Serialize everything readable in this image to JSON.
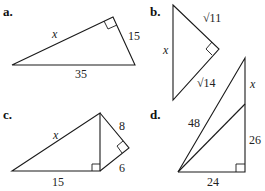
{
  "diagram": {
    "type": "right-triangle-exercises",
    "parts": [
      {
        "id": "a",
        "label": "a.",
        "labels": {
          "hypotenuse_side": "x",
          "short_leg": "15",
          "base": "35"
        }
      },
      {
        "id": "b",
        "label": "b.",
        "labels": {
          "upper_leg": "√11",
          "vertical_side": "x",
          "lower_leg": "√14"
        }
      },
      {
        "id": "c",
        "label": "c.",
        "labels": {
          "long_side": "x",
          "upper_leg": "8",
          "lower_leg": "6",
          "base": "15"
        }
      },
      {
        "id": "d",
        "label": "d.",
        "labels": {
          "long_diagonal": "48",
          "upper_segment": "x",
          "lower_segment": "26",
          "base": "24"
        }
      }
    ]
  }
}
